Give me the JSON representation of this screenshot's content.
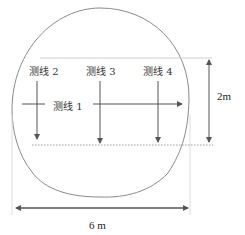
{
  "diagram": {
    "type": "tunnel cross-section survey line layout",
    "survey_lines": [
      {
        "id": 1,
        "label": "测线 1",
        "direction": "horizontal, left-to-right"
      },
      {
        "id": 2,
        "label": "测线 2",
        "direction": "vertical, top-to-bottom"
      },
      {
        "id": 3,
        "label": "测线 3",
        "direction": "vertical, top-to-bottom"
      },
      {
        "id": 4,
        "label": "测线 4",
        "direction": "vertical, top-to-bottom"
      }
    ],
    "dimensions": {
      "height_label": "2m",
      "width_label": "6 m"
    },
    "colors": {
      "outline": "#8a8a8a",
      "arrows": "#555555",
      "guide_lines": "#cfcfcf",
      "dotted_line": "#9a9a9a",
      "text": "#333333"
    }
  }
}
